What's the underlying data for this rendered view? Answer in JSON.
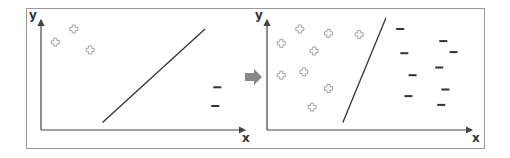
{
  "colors": {
    "frame": "#9a9a9a",
    "axis": "#444444",
    "boundary": "#333333",
    "plus": "#9a9a9a",
    "minus": "#333333",
    "arrow": "#888888"
  },
  "arrow_icon": "right-arrow-icon",
  "panels": [
    {
      "name": "before",
      "x_label": "x",
      "y_label": "y",
      "positive_points": [
        [
          0.07,
          0.78
        ],
        [
          0.16,
          0.9
        ],
        [
          0.24,
          0.71
        ]
      ],
      "negative_points": [
        [
          0.86,
          0.37
        ],
        [
          0.85,
          0.2
        ]
      ],
      "boundary": [
        [
          0.3,
          0.05
        ],
        [
          0.8,
          0.9
        ]
      ]
    },
    {
      "name": "after",
      "x_label": "x",
      "y_label": "y",
      "positive_points": [
        [
          0.16,
          0.9
        ],
        [
          0.3,
          0.86
        ],
        [
          0.45,
          0.85
        ],
        [
          0.07,
          0.77
        ],
        [
          0.23,
          0.7
        ],
        [
          0.07,
          0.48
        ],
        [
          0.18,
          0.51
        ],
        [
          0.3,
          0.36
        ],
        [
          0.22,
          0.19
        ]
      ],
      "negative_points": [
        [
          0.65,
          0.9
        ],
        [
          0.86,
          0.79
        ],
        [
          0.67,
          0.68
        ],
        [
          0.91,
          0.69
        ],
        [
          0.84,
          0.55
        ],
        [
          0.71,
          0.48
        ],
        [
          0.87,
          0.35
        ],
        [
          0.69,
          0.29
        ],
        [
          0.85,
          0.21
        ]
      ],
      "boundary": [
        [
          0.37,
          0.05
        ],
        [
          0.58,
          1.0
        ]
      ]
    }
  ]
}
